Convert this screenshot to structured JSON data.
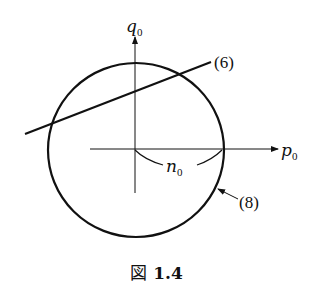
{
  "figure": {
    "caption_prefix": "図",
    "caption_number": "1.4"
  },
  "axes": {
    "horizontal_label": "p",
    "horizontal_sub": "0",
    "vertical_label": "q",
    "vertical_sub": "0"
  },
  "annotations": {
    "line_label": "(6)",
    "circle_label": "(8)",
    "radius_label": "n",
    "radius_sub": "0"
  },
  "colors": {
    "stroke": "#111111",
    "background": "#ffffff"
  }
}
